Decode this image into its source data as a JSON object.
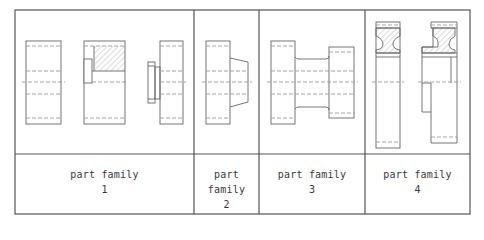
{
  "figure": {
    "type": "part-family-classification-table",
    "columns": [
      {
        "id": 1,
        "label": "part family",
        "number": "1",
        "drawings": [
          "plain-cylinder",
          "cylinder-with-hatched-keyway",
          "cylinder-with-small-flange"
        ]
      },
      {
        "id": 2,
        "label": "part family",
        "number": "2",
        "drawings": [
          "cylinder-with-tapered-shoulder"
        ]
      },
      {
        "id": 3,
        "label": "part family",
        "number": "3",
        "drawings": [
          "spool-with-neck"
        ]
      },
      {
        "id": 4,
        "label": "part family",
        "number": "4",
        "drawings": [
          "wheel-with-hatched-web",
          "stepped-wheel-with-hatched-web"
        ]
      }
    ],
    "colors": {
      "line": "#555555",
      "dashed": "#9a9a9a",
      "hatch": "#a8a8a8",
      "background": "#ffffff"
    }
  }
}
